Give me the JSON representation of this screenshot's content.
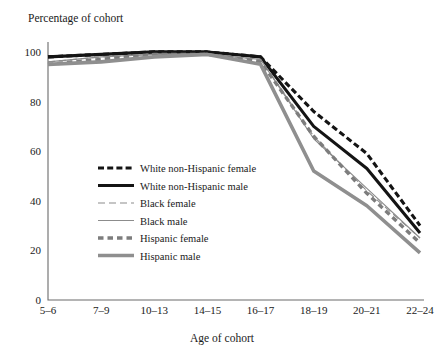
{
  "chart_data": {
    "type": "line",
    "title": "",
    "ylabel": "Percentage of cohort",
    "xlabel": "Age of cohort",
    "categories": [
      "5–6",
      "7–9",
      "10–13",
      "14–15",
      "16–17",
      "18–19",
      "20–21",
      "22–24"
    ],
    "yticks": [
      0,
      20,
      40,
      60,
      80,
      100
    ],
    "ylim": [
      0,
      104
    ],
    "grid": false,
    "legend_position": "inside-left-lower",
    "series": [
      {
        "name": "White non-Hispanic female",
        "values": [
          98,
          99,
          100,
          100,
          98,
          76,
          59,
          30
        ],
        "color": "#141414",
        "width": 3.1,
        "dash": "6,3.2"
      },
      {
        "name": "White non-Hispanic male",
        "values": [
          98,
          99,
          100,
          100,
          98,
          70,
          53,
          27
        ],
        "color": "#141414",
        "width": 3.1,
        "dash": "none"
      },
      {
        "name": "Black female",
        "values": [
          96,
          98,
          99,
          99,
          97,
          66,
          44,
          25
        ],
        "color": "#8c8c8c",
        "width": 1.1,
        "dash": "7,4"
      },
      {
        "name": "Black male",
        "values": [
          96,
          98,
          99,
          99,
          97,
          65,
          45,
          25
        ],
        "color": "#8c8c8c",
        "width": 1.1,
        "dash": "none"
      },
      {
        "name": "Hispanic female",
        "values": [
          95,
          97,
          99,
          99,
          96,
          66,
          43,
          23
        ],
        "color": "#7d7d7d",
        "width": 3.4,
        "dash": "5.5,4"
      },
      {
        "name": "Hispanic male",
        "values": [
          95,
          96,
          98,
          99,
          95,
          52,
          38,
          19
        ],
        "color": "#8f8f8f",
        "width": 3.6,
        "dash": "none"
      }
    ]
  }
}
